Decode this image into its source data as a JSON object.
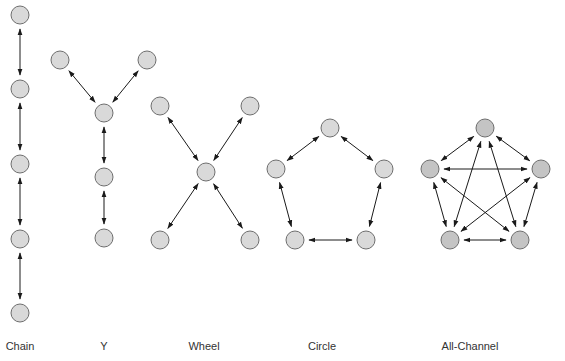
{
  "colors": {
    "node_fill_light": "#d9d9d9",
    "node_fill_dark": "#c4c4c4",
    "node_stroke": "#6e6e6e",
    "arrow": "#1a1a1a",
    "label": "#333333"
  },
  "networks": [
    {
      "id": "chain",
      "label": "Chain",
      "label_x": 20,
      "nodes": [
        [
          20,
          15
        ],
        [
          20,
          89
        ],
        [
          20,
          164
        ],
        [
          20,
          239
        ],
        [
          20,
          313
        ]
      ],
      "edges": [
        [
          0,
          1
        ],
        [
          1,
          2
        ],
        [
          2,
          3
        ],
        [
          3,
          4
        ]
      ],
      "dark": false
    },
    {
      "id": "y",
      "label": "Y",
      "label_x": 104,
      "nodes": [
        [
          60,
          60
        ],
        [
          147,
          60
        ],
        [
          104,
          113
        ],
        [
          104,
          177
        ],
        [
          104,
          238
        ]
      ],
      "edges": [
        [
          0,
          2
        ],
        [
          1,
          2
        ],
        [
          2,
          3
        ],
        [
          3,
          4
        ]
      ],
      "dark": false
    },
    {
      "id": "wheel",
      "label": "Wheel",
      "label_x": 204,
      "nodes": [
        [
          160,
          106
        ],
        [
          250,
          106
        ],
        [
          206,
          172
        ],
        [
          160,
          240
        ],
        [
          250,
          240
        ]
      ],
      "edges": [
        [
          0,
          2
        ],
        [
          1,
          2
        ],
        [
          3,
          2
        ],
        [
          4,
          2
        ]
      ],
      "dark": false
    },
    {
      "id": "circle",
      "label": "Circle",
      "label_x": 322,
      "nodes": [
        [
          330,
          128
        ],
        [
          276,
          169
        ],
        [
          384,
          169
        ],
        [
          295,
          240
        ],
        [
          366,
          240
        ]
      ],
      "edges": [
        [
          0,
          1
        ],
        [
          0,
          2
        ],
        [
          1,
          3
        ],
        [
          2,
          4
        ],
        [
          3,
          4
        ]
      ],
      "dark": false
    },
    {
      "id": "all-channel",
      "label": "All-Channel",
      "label_x": 470,
      "nodes": [
        [
          485,
          128
        ],
        [
          430,
          169
        ],
        [
          541,
          169
        ],
        [
          450,
          240
        ],
        [
          520,
          240
        ]
      ],
      "edges": [
        [
          0,
          1
        ],
        [
          0,
          2
        ],
        [
          0,
          3
        ],
        [
          0,
          4
        ],
        [
          1,
          2
        ],
        [
          1,
          3
        ],
        [
          1,
          4
        ],
        [
          2,
          3
        ],
        [
          2,
          4
        ],
        [
          3,
          4
        ]
      ],
      "dark": true
    }
  ]
}
